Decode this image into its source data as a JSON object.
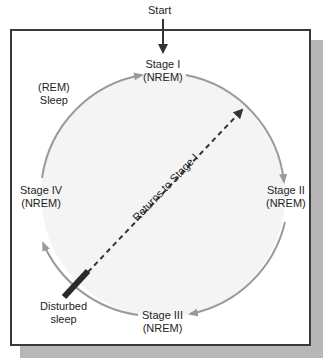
{
  "diagram": {
    "start_label": "Start",
    "nodes": [
      {
        "id": "stage1",
        "line1": "Stage I",
        "line2": "(NREM)"
      },
      {
        "id": "stage2",
        "line1": "Stage II",
        "line2": "(NREM)"
      },
      {
        "id": "stage3",
        "line1": "Stage III",
        "line2": "(NREM)"
      },
      {
        "id": "stage4",
        "line1": "Stage IV",
        "line2": "(NREM)"
      },
      {
        "id": "rem",
        "line1": "(REM)",
        "line2": "Sleep"
      }
    ],
    "disturbed": {
      "line1": "Disturbed",
      "line2": "sleep"
    },
    "return_label": "Returns to Stage I",
    "edges": [
      {
        "from": "Start",
        "to": "Stage I"
      },
      {
        "from": "Stage I",
        "to": "Stage II"
      },
      {
        "from": "Stage II",
        "to": "Stage III"
      },
      {
        "from": "Stage III",
        "to": "Stage IV"
      },
      {
        "from": "Stage IV",
        "to": "Stage I",
        "via": "(REM) Sleep"
      },
      {
        "from": "Disturbed sleep",
        "to": "Stage I",
        "style": "dashed",
        "label": "Returns to Stage I"
      }
    ],
    "colors": {
      "arc": "#9a9a9a",
      "circle_fill": "#f4f4f4",
      "frame_border": "#3a3a3a",
      "shadow": "#b7b7b7",
      "dashed": "#333333",
      "disturbed_bar": "#2a2a2a"
    }
  }
}
